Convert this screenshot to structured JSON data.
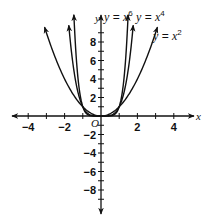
{
  "chart_data": {
    "type": "line",
    "title": "",
    "xlabel": "x",
    "ylabel": "y",
    "origin_label": "O",
    "xlim": [
      -5,
      5
    ],
    "ylim": [
      -10,
      10
    ],
    "grid": false,
    "x_ticks": [
      -4,
      -3,
      -2,
      -1,
      1,
      2,
      3,
      4
    ],
    "x_tick_labels": [
      {
        "value": -4,
        "label": "−4"
      },
      {
        "value": -2,
        "label": "−2"
      },
      {
        "value": 2,
        "label": "2"
      },
      {
        "value": 4,
        "label": "4"
      }
    ],
    "y_ticks": [
      -9,
      -8,
      -7,
      -6,
      -5,
      -4,
      -3,
      -2,
      -1,
      1,
      2,
      3,
      4,
      5,
      6,
      7,
      8,
      9
    ],
    "y_tick_labels": [
      {
        "value": 8,
        "label": "8"
      },
      {
        "value": 6,
        "label": "6"
      },
      {
        "value": 4,
        "label": "4"
      },
      {
        "value": 2,
        "label": "2"
      },
      {
        "value": -2,
        "label": "−2"
      },
      {
        "value": -4,
        "label": "−4"
      },
      {
        "value": -6,
        "label": "−6"
      },
      {
        "value": -8,
        "label": "−8"
      }
    ],
    "series": [
      {
        "name": "y = x^6",
        "label_text": "y = x",
        "exponent": "6",
        "power": 6,
        "x_range": [
          -1.49,
          1.49
        ],
        "label_pos": [
          104,
          21
        ]
      },
      {
        "name": "y = x^4",
        "label_text": "y = x",
        "exponent": "4",
        "power": 4,
        "x_range": [
          -1.77,
          1.77
        ],
        "label_pos": [
          136,
          21
        ]
      },
      {
        "name": "y = x^2",
        "label_text": "y = x",
        "exponent": "2",
        "power": 2,
        "x_range": [
          -3.1,
          3.1
        ],
        "label_pos": [
          153,
          40
        ]
      }
    ],
    "legend": "inline labels near curve tips",
    "colors": {
      "curve": "#111111",
      "axis": "#111111",
      "background": "#ffffff"
    }
  }
}
